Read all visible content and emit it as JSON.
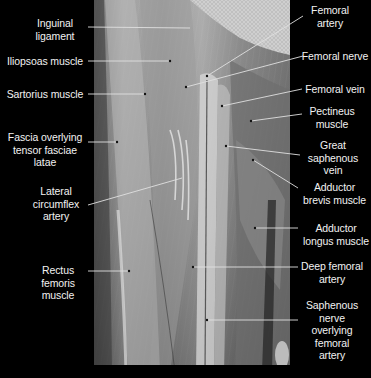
{
  "figure": {
    "colors": {
      "background": "#000000",
      "label_text": "#f2f2f2",
      "leader_line": "#e0e0e0"
    }
  },
  "labels_left": [
    {
      "id": "inguinal-ligament",
      "text": "Inguinal\nligament"
    },
    {
      "id": "iliopsoas-muscle",
      "text": "Iliopsoas muscle"
    },
    {
      "id": "sartorius-muscle",
      "text": "Sartorius muscle"
    },
    {
      "id": "fascia-tensor-fasciae-latae",
      "text": "Fascia overlying\ntensor fasciae\nlatae"
    },
    {
      "id": "lateral-circumflex-artery",
      "text": "Lateral\ncircumflex\nartery"
    },
    {
      "id": "rectus-femoris-muscle",
      "text": "Rectus\nfemoris\nmuscle"
    }
  ],
  "labels_right": [
    {
      "id": "femoral-artery",
      "text": "Femoral\nartery"
    },
    {
      "id": "femoral-nerve",
      "text": "Femoral nerve"
    },
    {
      "id": "femoral-vein",
      "text": "Femoral vein"
    },
    {
      "id": "pectineus-muscle",
      "text": "Pectineus\nmuscle"
    },
    {
      "id": "great-saphenous-vein",
      "text": "Great\nsaphenous\nvein"
    },
    {
      "id": "adductor-brevis-muscle",
      "text": "Adductor\nbrevis muscle"
    },
    {
      "id": "adductor-longus-muscle",
      "text": "Adductor\nlongus muscle"
    },
    {
      "id": "deep-femoral-artery",
      "text": "Deep femoral\nartery"
    },
    {
      "id": "saphenous-nerve",
      "text": "Saphenous\nnerve\noverlying\nfemoral\nartery"
    }
  ]
}
